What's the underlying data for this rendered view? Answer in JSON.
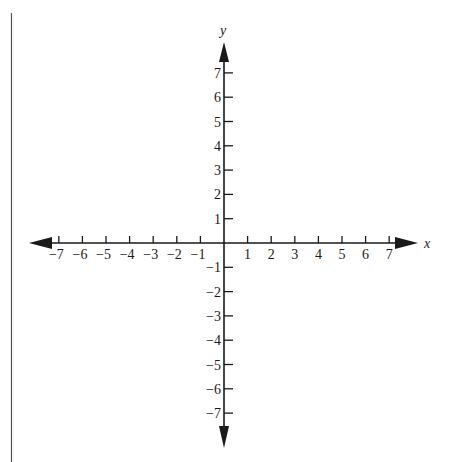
{
  "diagram": {
    "type": "cartesian-coordinate-plane",
    "x_axis": {
      "label": "x",
      "ticks": [
        -7,
        -6,
        -5,
        -4,
        -3,
        -2,
        -1,
        1,
        2,
        3,
        4,
        5,
        6,
        7
      ],
      "tick_labels": [
        "−7",
        "−6",
        "−5",
        "−4",
        "−3",
        "−2",
        "−1",
        "1",
        "2",
        "3",
        "4",
        "5",
        "6",
        "7"
      ]
    },
    "y_axis": {
      "label": "y",
      "ticks": [
        7,
        6,
        5,
        4,
        3,
        2,
        1,
        -1,
        -2,
        -3,
        -4,
        -5,
        -6,
        -7
      ],
      "tick_labels": [
        "7",
        "6",
        "5",
        "4",
        "3",
        "2",
        "1",
        "−1",
        "−2",
        "−3",
        "−4",
        "−5",
        "−6",
        "−7"
      ]
    },
    "colors": {
      "axis": "#1a1a1a",
      "border_line": "#555555",
      "background": "#ffffff"
    }
  }
}
